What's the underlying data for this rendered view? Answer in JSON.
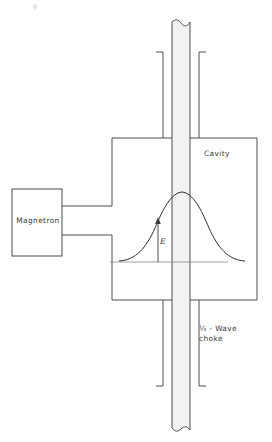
{
  "figure": {
    "type": "schematic-diagram",
    "background_color": "#ffffff",
    "line_color": "#3b3b3b",
    "tube_fill_color": "#f2f2f2"
  },
  "labels": {
    "magnetron": "Magnetron",
    "cavity": "Cavity",
    "choke_line1": "¼ - Wave",
    "choke_line2": "choke",
    "e_field": "E",
    "corner_mark": "g"
  },
  "components": [
    {
      "name": "magnetron-box",
      "label": "Magnetron",
      "shape": "rectangle",
      "x": 12,
      "y": 189,
      "width": 50,
      "height": 67
    },
    {
      "name": "cavity-body",
      "label": "Cavity",
      "shape": "polygon-enclosure",
      "left": 112,
      "right": 257,
      "top": 138,
      "bottom": 300
    },
    {
      "name": "vertical-tube",
      "label": "",
      "shape": "broken-tube",
      "left": 172,
      "right": 190,
      "top": 18,
      "bottom": 432
    },
    {
      "name": "quarter-wave-choke",
      "label": "¼ - Wave choke",
      "shape": "choke-arms",
      "upper_arm_top": 52,
      "lower_arm_bottom": 386,
      "left_arm_x": 162,
      "right_arm_x": 200
    },
    {
      "name": "waveguide-feed",
      "label": "",
      "shape": "two-parallel-lines",
      "upper_y": 206,
      "lower_y": 235,
      "from_x": 62,
      "to_x": 112
    }
  ],
  "field_plot": {
    "name": "e-field-distribution",
    "curve": "bell",
    "baseline_y": 262,
    "baseline_from_x": 110,
    "baseline_to_x": 228,
    "peak_x": 182,
    "peak_y": 192,
    "arrow_x": 158,
    "arrow_from_y": 262,
    "arrow_to_y": 219,
    "arrow_label": "E"
  }
}
